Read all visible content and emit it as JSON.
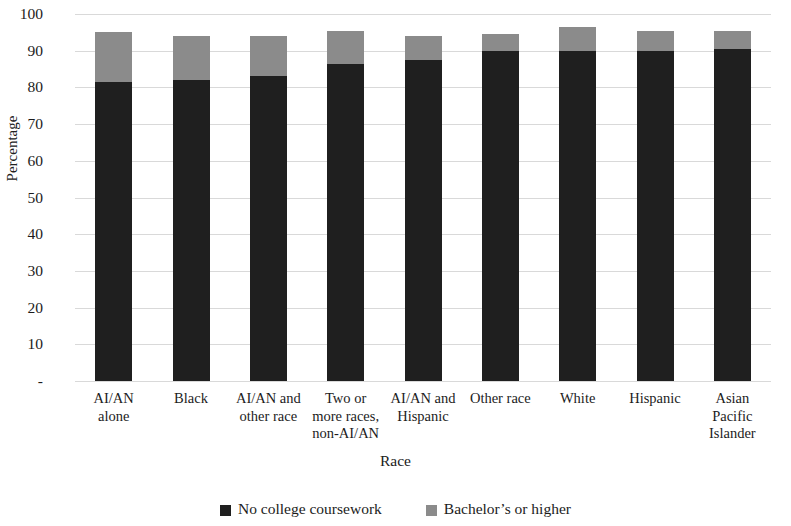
{
  "chart_data": {
    "type": "bar",
    "subtype": "stacked-column",
    "title": "",
    "xlabel": "Race",
    "ylabel": "Percentage",
    "ylim": [
      0,
      100
    ],
    "grid": true,
    "legend_position": "bottom",
    "categories": [
      "AI/AN alone",
      "Black",
      "AI/AN and other race",
      "Two or more races, non-AI/AN",
      "AI/AN and Hispanic",
      "Other race",
      "White",
      "Hispanic",
      "Asian Pacific Islander"
    ],
    "category_lines": [
      [
        "AI/AN",
        "alone"
      ],
      [
        "Black"
      ],
      [
        "AI/AN and",
        "other race"
      ],
      [
        "Two or",
        "more races,",
        "non-AI/AN"
      ],
      [
        "AI/AN and",
        "Hispanic"
      ],
      [
        "Other race"
      ],
      [
        "White"
      ],
      [
        "Hispanic"
      ],
      [
        "Asian",
        "Pacific",
        "Islander"
      ]
    ],
    "series": [
      {
        "name": "No college coursework",
        "color": "#1f1f1f",
        "values": [
          81.5,
          82.0,
          83.0,
          86.5,
          87.5,
          90.0,
          90.0,
          90.0,
          90.5
        ]
      },
      {
        "name": "Bachelor's or higher",
        "color": "#8b8b8b",
        "values": [
          13.5,
          12.0,
          11.0,
          9.0,
          6.5,
          4.5,
          6.5,
          5.5,
          5.0
        ]
      }
    ],
    "totals": [
      95.0,
      94.0,
      94.0,
      95.5,
      94.0,
      94.5,
      96.5,
      95.5,
      95.5
    ],
    "y_ticks": [
      {
        "value": 100,
        "label": "100"
      },
      {
        "value": 90,
        "label": "90"
      },
      {
        "value": 80,
        "label": "80"
      },
      {
        "value": 70,
        "label": "70"
      },
      {
        "value": 60,
        "label": "60"
      },
      {
        "value": 50,
        "label": "50"
      },
      {
        "value": 40,
        "label": "40"
      },
      {
        "value": 30,
        "label": "30"
      },
      {
        "value": 20,
        "label": "20"
      },
      {
        "value": 10,
        "label": "10"
      },
      {
        "value": 0,
        "label": "-"
      }
    ],
    "legend": [
      {
        "label": "No college coursework",
        "color": "#1f1f1f"
      },
      {
        "label": "Bachelor’s or higher",
        "color": "#8b8b8b"
      }
    ]
  },
  "colors": {
    "gridline": "#d9d9d9",
    "text": "#1c1c1c",
    "background": "#ffffff"
  }
}
